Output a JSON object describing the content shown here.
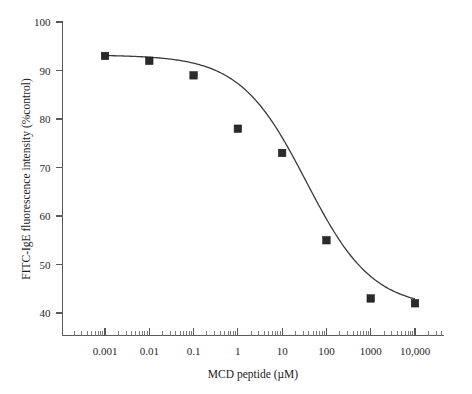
{
  "chart_data": {
    "type": "scatter",
    "title": "",
    "xlabel": "MCD peptide (µM)",
    "ylabel": "FITC-IgE fluorescence intensity (%control)",
    "xscale": "log",
    "yscale": "linear",
    "xlim": [
      0.0002,
      60000
    ],
    "ylim": [
      36,
      100
    ],
    "grid": false,
    "legend": null,
    "x_tick_labels": [
      "0.001",
      "0.01",
      "0.1",
      "1",
      "10",
      "100",
      "1000",
      "10,000"
    ],
    "x_tick_values": [
      0.001,
      0.01,
      0.1,
      1,
      10,
      100,
      1000,
      10000
    ],
    "y_tick_labels": [
      "40",
      "50",
      "60",
      "70",
      "80",
      "90",
      "100"
    ],
    "y_tick_values": [
      40,
      50,
      60,
      70,
      80,
      90,
      100
    ],
    "x": [
      0.001,
      0.01,
      0.1,
      1,
      10,
      100,
      1000,
      10000
    ],
    "values": [
      93,
      92,
      89,
      78,
      73,
      55,
      43,
      42
    ],
    "series": [
      {
        "name": "FITC-IgE binding",
        "marker": "square",
        "marker_color": "#2b2b2b",
        "x": [
          0.001,
          0.01,
          0.1,
          1,
          10,
          100,
          1000,
          10000
        ],
        "values": [
          93,
          92,
          89,
          78,
          73,
          55,
          43,
          42
        ]
      },
      {
        "name": "sigmoidal fit",
        "type": "line",
        "line_color": "#3a3a3a",
        "fit_top": 93.2,
        "fit_bottom": 41.0,
        "fit_ic50": 35,
        "fit_hillslope": 0.58
      }
    ]
  },
  "axes": {
    "x_title": "MCD peptide (µM)",
    "y_title": "FITC-IgE fluorescence intensity (%control)",
    "x_ticks": [
      {
        "label": "0.001",
        "value": 0.001
      },
      {
        "label": "0.01",
        "value": 0.01
      },
      {
        "label": "0.1",
        "value": 0.1
      },
      {
        "label": "1",
        "value": 1
      },
      {
        "label": "10",
        "value": 10
      },
      {
        "label": "100",
        "value": 100
      },
      {
        "label": "1000",
        "value": 1000
      },
      {
        "label": "10,000",
        "value": 10000
      }
    ],
    "y_ticks": [
      {
        "label": "100",
        "value": 100
      },
      {
        "label": "90",
        "value": 90
      },
      {
        "label": "80",
        "value": 80
      },
      {
        "label": "70",
        "value": 70
      },
      {
        "label": "60",
        "value": 60
      },
      {
        "label": "50",
        "value": 50
      },
      {
        "label": "40",
        "value": 40
      }
    ]
  },
  "style": {
    "axis_color": "#5a5a5a",
    "curve_color": "#3a3a3a",
    "marker_color": "#2b2b2b",
    "text_color": "#1a1a1a",
    "background": "#ffffff"
  }
}
